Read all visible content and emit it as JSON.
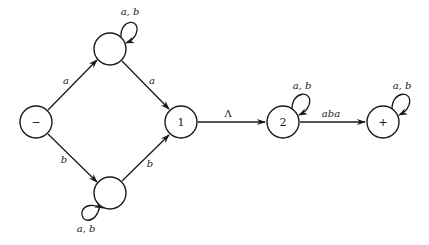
{
  "diagram": {
    "type": "finite-automaton",
    "states": [
      {
        "id": "start",
        "label": "−",
        "cx": 36,
        "cy": 122
      },
      {
        "id": "top",
        "label": "",
        "cx": 110,
        "cy": 49
      },
      {
        "id": "bottom",
        "label": "",
        "cx": 110,
        "cy": 193
      },
      {
        "id": "s1",
        "label": "1",
        "cx": 181,
        "cy": 122
      },
      {
        "id": "s2",
        "label": "2",
        "cx": 283,
        "cy": 122
      },
      {
        "id": "final",
        "label": "+",
        "cx": 383,
        "cy": 122
      }
    ],
    "edges": [
      {
        "from": "start",
        "to": "top",
        "label": "a"
      },
      {
        "from": "start",
        "to": "bottom",
        "label": "b"
      },
      {
        "from": "top",
        "to": "s1",
        "label": "a"
      },
      {
        "from": "bottom",
        "to": "s1",
        "label": "b"
      },
      {
        "from": "s1",
        "to": "s2",
        "label": "Λ"
      },
      {
        "from": "s2",
        "to": "final",
        "label": "aba"
      },
      {
        "from": "top",
        "to": "top",
        "label": "a, b"
      },
      {
        "from": "bottom",
        "to": "bottom",
        "label": "a, b"
      },
      {
        "from": "s2",
        "to": "s2",
        "label": "a, b"
      },
      {
        "from": "final",
        "to": "final",
        "label": "a, b"
      }
    ]
  },
  "labels": {
    "start": "−",
    "s1": "1",
    "s2": "2",
    "final": "+",
    "e_start_top": "a",
    "e_start_bottom": "b",
    "e_top_s1": "a",
    "e_bottom_s1": "b",
    "e_s1_s2": "Λ",
    "e_s2_final": "aba",
    "loop_top": "a, b",
    "loop_bottom": "a, b",
    "loop_s2": "a, b",
    "loop_final": "a, b"
  }
}
